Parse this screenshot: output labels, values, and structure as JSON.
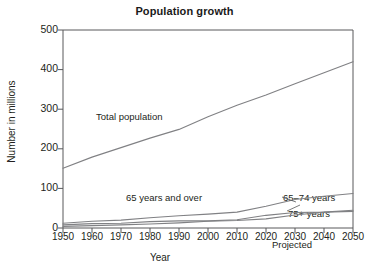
{
  "chart_data": {
    "type": "line",
    "title": "Population growth",
    "xlabel": "Year",
    "ylabel": "Number in millions",
    "xlim": [
      1950,
      2050
    ],
    "ylim": [
      0,
      500
    ],
    "grid": false,
    "legend_position": "inline-labels",
    "x": [
      1950,
      1960,
      1970,
      1980,
      1990,
      2000,
      2010,
      2020,
      2030,
      2040,
      2050
    ],
    "xticks": [
      "1950",
      "1960",
      "1970",
      "1980",
      "1990",
      "2000",
      "2010",
      "2020",
      "2030",
      "2040",
      "2050"
    ],
    "yticks": [
      "0",
      "100",
      "200",
      "300",
      "400",
      "500"
    ],
    "annotations": [
      {
        "text": "Projected",
        "near_x": 2035
      }
    ],
    "series": [
      {
        "name": "Total population",
        "label": "Total population",
        "color": "#808184",
        "values": [
          151,
          179,
          203,
          227,
          249,
          281,
          310,
          336,
          364,
          392,
          420
        ]
      },
      {
        "name": "65 years and over",
        "label": "65 years and over",
        "color": "#808184",
        "values": [
          12,
          17,
          20,
          26,
          31,
          35,
          40,
          55,
          72,
          80,
          87
        ]
      },
      {
        "name": "65-74 years",
        "label": "65–74 years",
        "color": "#808184",
        "values": [
          8,
          11,
          12,
          16,
          18,
          18,
          21,
          32,
          39,
          40,
          45
        ]
      },
      {
        "name": "75+ years",
        "label": "75+ years",
        "color": "#808184",
        "values": [
          4,
          6,
          8,
          10,
          13,
          17,
          19,
          23,
          33,
          40,
          42
        ]
      }
    ]
  },
  "colors": {
    "axis": "#58595b",
    "line": "#808184",
    "text": "#231f20"
  }
}
